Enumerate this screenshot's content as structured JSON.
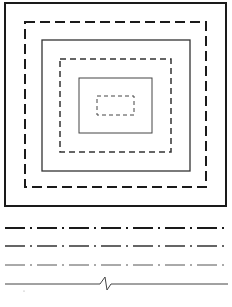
{
  "diagram": {
    "title": "",
    "colors": {
      "background": "#ffffff",
      "stroke": "#1a1a1a",
      "stroke_medium": "#333333",
      "stroke_light": "#555555"
    },
    "rectangles": [
      {
        "name": "outer-solid-rect",
        "style": "solid",
        "weight": "thick"
      },
      {
        "name": "outer-dashed-rect",
        "style": "dashed",
        "weight": "thick"
      },
      {
        "name": "middle-solid-rect",
        "style": "solid",
        "weight": "medium"
      },
      {
        "name": "middle-dashed-rect",
        "style": "dashed",
        "weight": "medium"
      },
      {
        "name": "inner-solid-rect",
        "style": "solid",
        "weight": "thin"
      },
      {
        "name": "inner-dashed-rect",
        "style": "dashed",
        "weight": "thin"
      }
    ],
    "lines": [
      {
        "name": "chain-line-thick",
        "style": "dash-dot",
        "weight": "thick"
      },
      {
        "name": "chain-line-medium",
        "style": "dash-dot",
        "weight": "medium"
      },
      {
        "name": "chain-line-thin",
        "style": "dash-dot",
        "weight": "thin"
      },
      {
        "name": "break-line",
        "style": "break",
        "weight": "thin"
      }
    ]
  }
}
